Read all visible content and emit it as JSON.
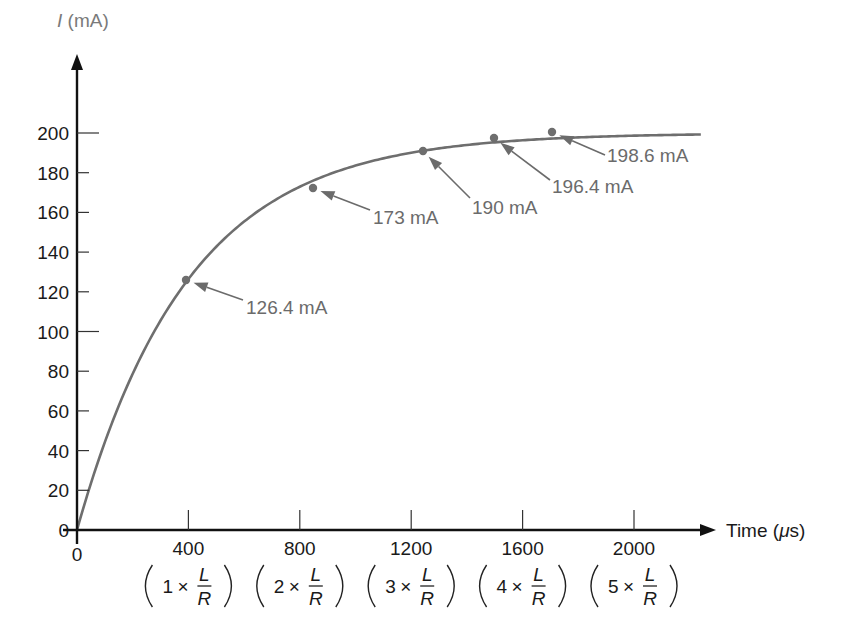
{
  "chart_data": {
    "type": "line",
    "title": "",
    "xlabel": "Time (μs)",
    "ylabel_symbol": "I",
    "ylabel_unit": "(mA)",
    "xlim": [
      0,
      2250
    ],
    "ylim": [
      0,
      215
    ],
    "x_ticks": [
      0,
      400,
      800,
      1200,
      1600,
      2000
    ],
    "x_tick_labels": [
      "0",
      "400",
      "800",
      "1200",
      "1600",
      "2000"
    ],
    "x_tick_sublabels": [
      {
        "n": "1",
        "text": "1 × L/R"
      },
      {
        "n": "2",
        "text": "2 × L/R"
      },
      {
        "n": "3",
        "text": "3 × L/R"
      },
      {
        "n": "4",
        "text": "4 × L/R"
      },
      {
        "n": "5",
        "text": "5 × L/R"
      }
    ],
    "y_ticks": [
      0,
      20,
      40,
      60,
      80,
      100,
      120,
      140,
      160,
      180,
      200
    ],
    "y_tick_labels": [
      "0",
      "20",
      "40",
      "60",
      "80",
      "100",
      "120",
      "140",
      "160",
      "180",
      "200"
    ],
    "grid": false,
    "series": [
      {
        "name": "I(t) = 200(1 − e^(−t/τ)) mA, τ = 400 μs",
        "asymptote": 200,
        "tau": 400,
        "x_end": 2240
      }
    ],
    "points": [
      {
        "t": 400,
        "value": 126.4,
        "label": "126.4 mA"
      },
      {
        "t": 800,
        "value": 173,
        "label": "173 mA"
      },
      {
        "t": 1200,
        "value": 190,
        "label": "190 mA"
      },
      {
        "t": 1600,
        "value": 196.4,
        "label": "196.4 mA"
      },
      {
        "t": 2000,
        "value": 198.6,
        "label": "198.6 mA"
      }
    ],
    "frac_symbols": {
      "times": "×",
      "num": "L",
      "den": "R"
    },
    "colors": {
      "axis": "#111111",
      "curve": "#6e6e6e",
      "annotation": "#6b6b6b"
    }
  },
  "labels": {
    "ylabel_symbol": "I",
    "ylabel_unit": " (mA)",
    "xlabel": "Time (",
    "xlabel_mu": "μ",
    "xlabel_end": "s)"
  }
}
